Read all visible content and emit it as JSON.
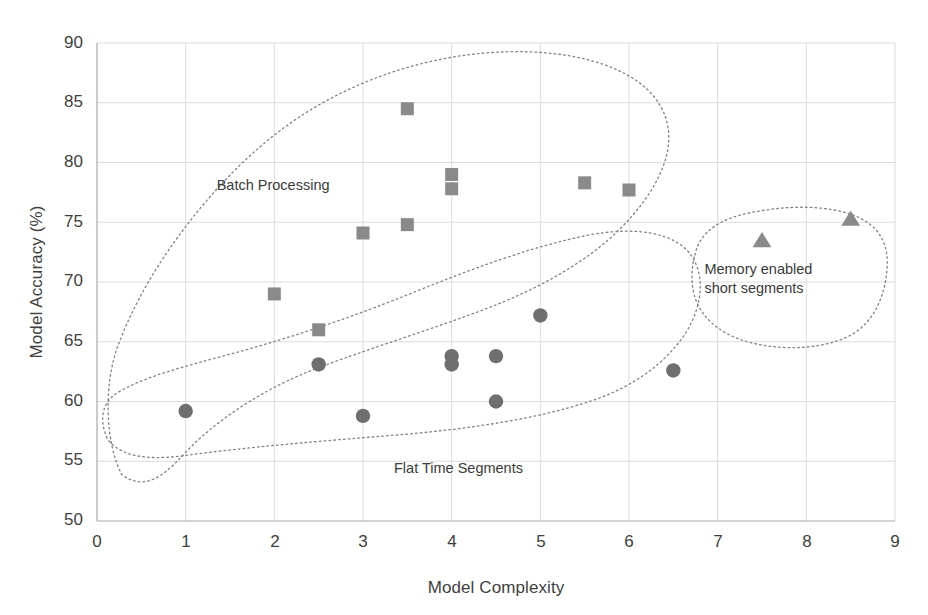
{
  "chart_data": {
    "type": "scatter",
    "title": "",
    "xlabel": "Model Complexity",
    "ylabel": "Model Accuracy (%)",
    "xlim": [
      0,
      9
    ],
    "ylim": [
      50,
      90
    ],
    "xticks": [
      "0",
      "1",
      "2",
      "3",
      "4",
      "5",
      "6",
      "7",
      "8",
      "9"
    ],
    "yticks": [
      "50",
      "55",
      "60",
      "65",
      "70",
      "75",
      "80",
      "85",
      "90"
    ],
    "grid": true,
    "legend_position": "none",
    "series": [
      {
        "name": "Batch Processing",
        "marker": "square",
        "color": "#8a8a8a",
        "points": [
          {
            "x": 2.0,
            "y": 69.0
          },
          {
            "x": 2.5,
            "y": 66.0
          },
          {
            "x": 3.0,
            "y": 74.1
          },
          {
            "x": 3.5,
            "y": 84.5
          },
          {
            "x": 3.5,
            "y": 74.8
          },
          {
            "x": 4.0,
            "y": 79.0
          },
          {
            "x": 4.0,
            "y": 77.8
          },
          {
            "x": 5.5,
            "y": 78.3
          },
          {
            "x": 6.0,
            "y": 77.7
          }
        ]
      },
      {
        "name": "Flat Time Segments",
        "marker": "circle",
        "color": "#6f6f6f",
        "points": [
          {
            "x": 1.0,
            "y": 59.2
          },
          {
            "x": 2.5,
            "y": 63.1
          },
          {
            "x": 3.0,
            "y": 58.8
          },
          {
            "x": 4.0,
            "y": 63.8
          },
          {
            "x": 4.0,
            "y": 63.1
          },
          {
            "x": 4.5,
            "y": 63.8
          },
          {
            "x": 4.5,
            "y": 60.0
          },
          {
            "x": 5.0,
            "y": 67.2
          },
          {
            "x": 6.5,
            "y": 62.6
          }
        ]
      },
      {
        "name": "Memory enabled short segments",
        "marker": "triangle",
        "color": "#8a8a8a",
        "points": [
          {
            "x": 7.5,
            "y": 73.4
          },
          {
            "x": 8.5,
            "y": 75.2
          }
        ]
      }
    ],
    "annotations": [
      {
        "text": "Batch Processing",
        "x": 1.35,
        "y": 78.1
      },
      {
        "text": "Flat Time Segments",
        "x": 3.35,
        "y": 54.4
      },
      {
        "text": "Memory enabled",
        "x": 6.85,
        "y": 71.1
      },
      {
        "text": "short segments",
        "x": 6.85,
        "y": 69.5
      }
    ],
    "clusters": [
      {
        "label": "Batch Processing",
        "outline": "dotted"
      },
      {
        "label": "Flat Time Segments",
        "outline": "dotted"
      },
      {
        "label": "Memory enabled short segments",
        "outline": "dotted"
      }
    ],
    "colors": {
      "square_marker": "#8a8a8a",
      "circle_marker": "#6f6f6f",
      "triangle_marker": "#8a8a8a",
      "gridline": "#d9d9d9",
      "axis": "#b0b0b0",
      "cluster_outline": "#777777",
      "text": "#3f3f3f",
      "background": "#ffffff"
    }
  }
}
